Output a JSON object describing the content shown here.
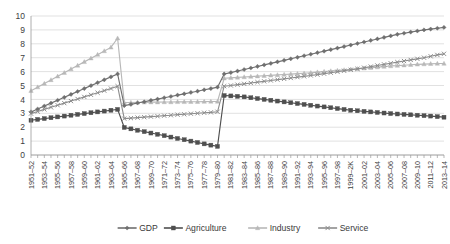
{
  "chart_data": {
    "type": "line",
    "title": "",
    "subtitle": "",
    "xlabel": "",
    "ylabel": "",
    "ylim": [
      0,
      10
    ],
    "yticks": [
      0,
      1,
      2,
      3,
      4,
      5,
      6,
      7,
      8,
      9,
      10
    ],
    "grid": true,
    "legend_position": "bottom",
    "categories": [
      "1951–52",
      "1952–53",
      "1953–54",
      "1954–55",
      "1955–56",
      "1956–57",
      "1957–58",
      "1958–59",
      "1959–60",
      "1960–61",
      "1961–62",
      "1962–63",
      "1963–64",
      "1964–65",
      "1965–66",
      "1966–67",
      "1967–68",
      "1968–69",
      "1969–70",
      "1970–71",
      "1971–72",
      "1972–73",
      "1973–74",
      "1974–75",
      "1975–76",
      "1976–77",
      "1977–78",
      "1978–79",
      "1979–80",
      "1980–81",
      "1981–82",
      "1982–83",
      "1983–84",
      "1984–85",
      "1985–86",
      "1986–87",
      "1987–88",
      "1988–89",
      "1989–90",
      "1990–91",
      "1991–92",
      "1992–93",
      "1993–94",
      "1994–95",
      "1995–96",
      "1996–97",
      "1997–98",
      "1998–99",
      "1999–2K",
      "2000–01",
      "2001–02",
      "2002–03",
      "2003–04",
      "2004–05",
      "2005–06",
      "2006–07",
      "2007–08",
      "2008–09",
      "2009–10",
      "2010–11",
      "2011–12",
      "2012–13",
      "2013–14"
    ],
    "xtick_labels": [
      "1951–52",
      "1953–54",
      "1955–56",
      "1957–58",
      "1959–60",
      "1961–62",
      "1963–64",
      "1965–66",
      "1967–68",
      "1969–70",
      "1971–72",
      "1973–74",
      "1975–76",
      "1977–78",
      "1979–80",
      "1981–82",
      "1983–84",
      "1985–86",
      "1987–88",
      "1989–90",
      "1991–92",
      "1993–94",
      "1995–96",
      "1997–98",
      "1999–2K",
      "2001–02",
      "2003–04",
      "2005–06",
      "2007–08",
      "2009–10",
      "2011–12",
      "2013–14"
    ],
    "series": [
      {
        "name": "GDP",
        "color": "#6f6f6f",
        "marker": "diamond",
        "values": [
          3.1,
          3.31,
          3.52,
          3.73,
          3.94,
          4.15,
          4.36,
          4.57,
          4.78,
          4.99,
          5.2,
          5.41,
          5.62,
          5.83,
          3.55,
          3.64,
          3.74,
          3.83,
          3.93,
          4.02,
          4.12,
          4.21,
          4.31,
          4.4,
          4.5,
          4.59,
          4.69,
          4.78,
          4.88,
          5.83,
          5.93,
          6.04,
          6.15,
          6.26,
          6.37,
          6.48,
          6.59,
          6.7,
          6.81,
          6.92,
          7.03,
          7.14,
          7.25,
          7.36,
          7.47,
          7.58,
          7.69,
          7.8,
          7.91,
          8.02,
          8.13,
          8.24,
          8.35,
          8.46,
          8.57,
          8.68,
          8.76,
          8.84,
          8.92,
          9.0,
          9.06,
          9.12,
          9.18
        ]
      },
      {
        "name": "Agriculture",
        "color": "#4f4f4f",
        "marker": "square",
        "values": [
          2.5,
          2.56,
          2.62,
          2.68,
          2.74,
          2.8,
          2.86,
          2.92,
          2.98,
          3.04,
          3.1,
          3.16,
          3.22,
          3.28,
          1.98,
          1.88,
          1.78,
          1.68,
          1.58,
          1.49,
          1.39,
          1.29,
          1.19,
          1.1,
          1.0,
          0.9,
          0.8,
          0.71,
          0.62,
          4.28,
          4.25,
          4.22,
          4.18,
          4.12,
          4.06,
          4.0,
          3.94,
          3.88,
          3.82,
          3.76,
          3.7,
          3.64,
          3.58,
          3.52,
          3.46,
          3.4,
          3.34,
          3.28,
          3.22,
          3.18,
          3.14,
          3.1,
          3.06,
          3.02,
          2.98,
          2.95,
          2.92,
          2.89,
          2.86,
          2.83,
          2.8,
          2.76,
          2.72
        ]
      },
      {
        "name": "Industry",
        "color": "#b8b8b8",
        "marker": "triangle",
        "values": [
          4.62,
          4.88,
          5.14,
          5.4,
          5.66,
          5.92,
          6.18,
          6.44,
          6.7,
          6.96,
          7.22,
          7.48,
          7.74,
          8.4,
          3.78,
          3.78,
          3.79,
          3.79,
          3.8,
          3.8,
          3.81,
          3.81,
          3.82,
          3.82,
          3.83,
          3.83,
          3.84,
          3.85,
          3.85,
          5.52,
          5.55,
          5.58,
          5.61,
          5.64,
          5.67,
          5.7,
          5.73,
          5.76,
          5.79,
          5.82,
          5.85,
          5.88,
          5.92,
          5.96,
          6.0,
          6.04,
          6.08,
          6.12,
          6.16,
          6.2,
          6.24,
          6.28,
          6.32,
          6.36,
          6.4,
          6.43,
          6.46,
          6.49,
          6.52,
          6.54,
          6.56,
          6.58,
          6.58
        ]
      },
      {
        "name": "Service",
        "color": "#8d8d8d",
        "marker": "cross",
        "values": [
          2.98,
          3.13,
          3.28,
          3.43,
          3.58,
          3.73,
          3.88,
          4.03,
          4.18,
          4.33,
          4.48,
          4.63,
          4.78,
          4.95,
          2.62,
          2.65,
          2.69,
          2.72,
          2.76,
          2.79,
          2.83,
          2.86,
          2.9,
          2.93,
          2.97,
          3.0,
          3.04,
          3.07,
          3.11,
          4.95,
          5.0,
          5.06,
          5.12,
          5.18,
          5.24,
          5.3,
          5.36,
          5.42,
          5.48,
          5.54,
          5.6,
          5.66,
          5.72,
          5.78,
          5.85,
          5.92,
          5.99,
          6.06,
          6.13,
          6.2,
          6.28,
          6.36,
          6.44,
          6.52,
          6.6,
          6.68,
          6.76,
          6.84,
          6.92,
          7.0,
          7.1,
          7.2,
          7.28
        ]
      }
    ]
  },
  "legend": {
    "items": [
      {
        "label": "GDP"
      },
      {
        "label": "Agriculture"
      },
      {
        "label": "Industry"
      },
      {
        "label": "Service"
      }
    ]
  }
}
